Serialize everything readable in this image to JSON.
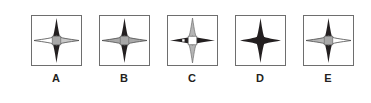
{
  "puzzle": {
    "type": "multiple-choice-figure-row",
    "palette": {
      "dark": "#231f20",
      "gray": "#a8a8a8",
      "light_gray": "#c9c9c9",
      "white": "#ffffff",
      "box_border": "#6e6e6e",
      "label_color": "#231f20",
      "background": "#ffffff"
    },
    "options": [
      {
        "label": "A",
        "name": "option-a",
        "shapes": {
          "vertical_star": "dark",
          "horizontal_left_wing": "white",
          "horizontal_right_wing": "light_gray",
          "center_square": "gray",
          "center_dot": "none"
        }
      },
      {
        "label": "B",
        "name": "option-b",
        "shapes": {
          "vertical_star": "dark",
          "horizontal_left_wing": "gray",
          "horizontal_right_wing": "gray",
          "center_square": "gray",
          "center_dot": "none"
        }
      },
      {
        "label": "C",
        "name": "option-c",
        "shapes": {
          "vertical_star": "gray",
          "horizontal_left_wing": "dark",
          "horizontal_right_wing": "dark",
          "center_square": "white",
          "center_dot": "white"
        }
      },
      {
        "label": "D",
        "name": "option-d",
        "shapes": {
          "vertical_star": "dark",
          "horizontal_left_wing": "dark",
          "horizontal_right_wing": "dark",
          "center_square": "none",
          "center_dot": "none"
        }
      },
      {
        "label": "E",
        "name": "option-e",
        "shapes": {
          "vertical_star": "dark",
          "horizontal_left_wing": "gray",
          "horizontal_right_wing": "white",
          "center_square": "gray",
          "center_dot": "none"
        }
      }
    ]
  }
}
